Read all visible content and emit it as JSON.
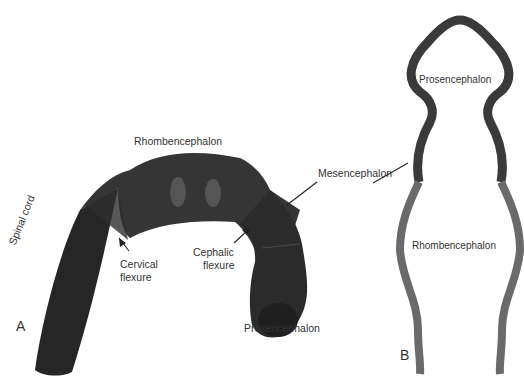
{
  "panel_a": {
    "letter": "A",
    "labels": {
      "rhombencephalon": "Rhombencephalon",
      "mesencephalon": "Mesencephalon",
      "spinal_cord": "Spinal cord",
      "cervical_flexure_1": "Cervical",
      "cervical_flexure_2": "flexure",
      "cephalic_flexure_1": "Cephalic",
      "cephalic_flexure_2": "flexure",
      "prosencephalon": "Prosencephalon"
    }
  },
  "panel_b": {
    "letter": "B",
    "labels": {
      "prosencephalon": "Prosencephalon",
      "rhombencephalon": "Rhombencephalon"
    }
  },
  "colors": {
    "dark_tissue": "#2a2a2a",
    "mid_tissue": "#3a3a3a",
    "lower_wall": "#6b6b6b",
    "upper_wall": "#3c3c3c"
  }
}
